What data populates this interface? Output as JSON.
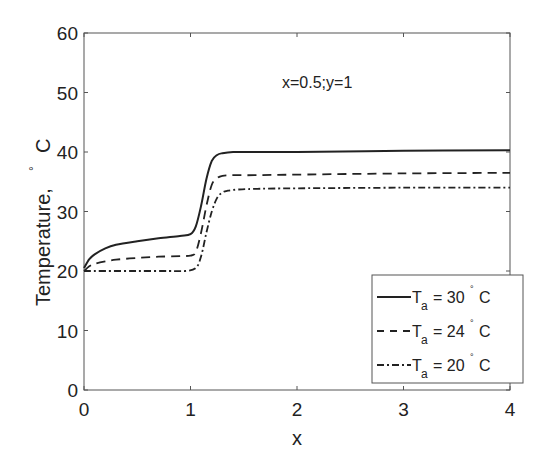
{
  "chart_data": {
    "type": "line",
    "title": "",
    "annotation": "x=0.5;y=1",
    "xlabel": "x",
    "ylabel": "Temperature,  ° C",
    "ylabel_parts": {
      "text": "Temperature,",
      "degree": "°",
      "unit": "C"
    },
    "xlim": [
      0,
      4
    ],
    "ylim": [
      0,
      60
    ],
    "xticks": [
      0,
      1,
      2,
      3,
      4
    ],
    "yticks": [
      0,
      10,
      20,
      30,
      40,
      50,
      60
    ],
    "grid": false,
    "legend_position": "lower right",
    "series": [
      {
        "name": "T_a = 30° C",
        "label_main": "T",
        "label_sub": "a",
        "label_value": "= 30",
        "label_unit": "C",
        "style": "solid",
        "x": [
          0,
          0.05,
          0.1,
          0.2,
          0.3,
          0.5,
          0.7,
          0.9,
          1.0,
          1.05,
          1.1,
          1.15,
          1.2,
          1.25,
          1.3,
          1.4,
          1.6,
          2.0,
          3.0,
          4.0
        ],
        "y": [
          20.5,
          22.0,
          22.8,
          23.8,
          24.4,
          25.0,
          25.5,
          25.9,
          26.2,
          27.5,
          31.0,
          35.5,
          38.5,
          39.5,
          39.8,
          40.0,
          40.0,
          40.0,
          40.2,
          40.3
        ]
      },
      {
        "name": "T_a = 24° C",
        "label_main": "T",
        "label_sub": "a",
        "label_value": "= 24",
        "label_unit": "C",
        "style": "dashed",
        "x": [
          0,
          0.05,
          0.1,
          0.2,
          0.3,
          0.5,
          0.7,
          0.9,
          1.0,
          1.05,
          1.1,
          1.15,
          1.2,
          1.25,
          1.3,
          1.4,
          1.6,
          2.0,
          3.0,
          4.0
        ],
        "y": [
          20.0,
          20.8,
          21.2,
          21.6,
          21.9,
          22.2,
          22.4,
          22.5,
          22.6,
          23.2,
          26.5,
          31.0,
          34.5,
          35.6,
          36.0,
          36.1,
          36.1,
          36.2,
          36.4,
          36.5
        ]
      },
      {
        "name": "T_a = 20° C",
        "label_main": "T",
        "label_sub": "a",
        "label_value": "= 20",
        "label_unit": "C",
        "style": "dashdot",
        "x": [
          0,
          0.2,
          0.5,
          0.8,
          0.95,
          1.05,
          1.1,
          1.15,
          1.2,
          1.25,
          1.3,
          1.35,
          1.45,
          1.6,
          2.0,
          3.0,
          4.0
        ],
        "y": [
          20.0,
          20.0,
          20.0,
          20.0,
          20.0,
          20.5,
          22.5,
          26.5,
          30.0,
          32.3,
          33.2,
          33.5,
          33.7,
          33.8,
          33.9,
          34.0,
          34.0
        ]
      }
    ]
  }
}
